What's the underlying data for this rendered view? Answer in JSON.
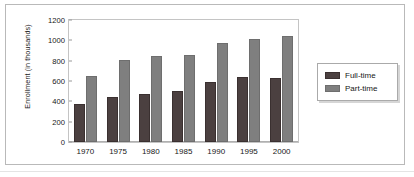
{
  "figure": {
    "background_color": "#ffffff",
    "border_color": "#b9b9b9"
  },
  "legend": {
    "position": "right",
    "entries": [
      {
        "label": "Full-time",
        "color": "#4b4040",
        "swatch_name": "legend-swatch-full-time"
      },
      {
        "label": "Part-time",
        "color": "#7f7f7f",
        "swatch_name": "legend-swatch-part-time"
      }
    ]
  },
  "chart_data": {
    "type": "bar",
    "title": "",
    "subtitle": "",
    "xlabel": "",
    "ylabel": "Enrollment (in thousands)",
    "categories": [
      "1970",
      "1975",
      "1980",
      "1985",
      "1990",
      "1995",
      "2000"
    ],
    "series": [
      {
        "name": "Full-time",
        "color": "#4b4040",
        "values": [
          370,
          440,
          470,
          500,
          595,
          635,
          625
        ]
      },
      {
        "name": "Part-time",
        "color": "#7f7f7f",
        "values": [
          650,
          805,
          850,
          860,
          975,
          1010,
          1045
        ]
      }
    ],
    "ylim": [
      0,
      1200
    ],
    "yticks": [
      0,
      200,
      400,
      600,
      800,
      1000,
      1200
    ],
    "ytick_labels": [
      "0",
      "200",
      "400",
      "600",
      "800",
      "1000",
      "1200"
    ],
    "grid": false,
    "legend_position": "right",
    "orientation": "vertical",
    "bar_grouping": "grouped"
  }
}
